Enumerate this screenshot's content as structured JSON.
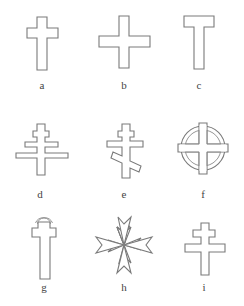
{
  "figure": {
    "stroke_color": "#7a7a7a",
    "background_color": "#ffffff",
    "items": [
      {
        "label": "a",
        "shape": "latin-cross"
      },
      {
        "label": "b",
        "shape": "greek-cross"
      },
      {
        "label": "c",
        "shape": "tau-cross"
      },
      {
        "label": "d",
        "shape": "papal-cross"
      },
      {
        "label": "e",
        "shape": "orthodox-cross"
      },
      {
        "label": "f",
        "shape": "celtic-cross"
      },
      {
        "label": "g",
        "shape": "latin-cross-with-arc"
      },
      {
        "label": "h",
        "shape": "maltese-cross"
      },
      {
        "label": "i",
        "shape": "cross-of-lorraine"
      }
    ]
  }
}
